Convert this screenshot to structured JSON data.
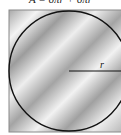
{
  "caption": "A = 6πr + 6πr",
  "diagram": {
    "shape": "circle inscribed in square",
    "radius_label": "r",
    "colors": {
      "square_fill_light": "#f2f2f2",
      "square_fill_dark": "#9a9a9a",
      "circle_stroke": "#111111",
      "radius_stroke": "#111111"
    }
  }
}
